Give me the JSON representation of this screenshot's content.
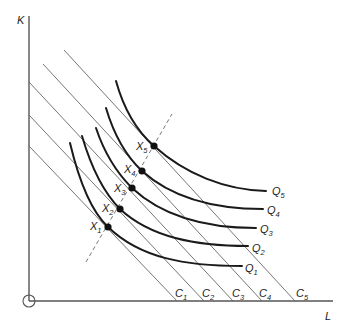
{
  "diagram": {
    "axes": {
      "y_label": "K",
      "x_label": "L"
    },
    "isocost_lines": [
      {
        "name": "C",
        "sub": "1"
      },
      {
        "name": "C",
        "sub": "2"
      },
      {
        "name": "C",
        "sub": "3"
      },
      {
        "name": "C",
        "sub": "4"
      },
      {
        "name": "C",
        "sub": "5"
      }
    ],
    "isoquants": [
      {
        "name": "Q",
        "sub": "1"
      },
      {
        "name": "Q",
        "sub": "2"
      },
      {
        "name": "Q",
        "sub": "3"
      },
      {
        "name": "Q",
        "sub": "4"
      },
      {
        "name": "Q",
        "sub": "5"
      }
    ],
    "tangency_points": [
      {
        "name": "X",
        "sub": "1"
      },
      {
        "name": "X",
        "sub": "2"
      },
      {
        "name": "X",
        "sub": "3"
      },
      {
        "name": "X",
        "sub": "4"
      },
      {
        "name": "X",
        "sub": "5"
      }
    ],
    "expansion_path": "dashed line through X1–X5",
    "origin_marker": "circle"
  }
}
